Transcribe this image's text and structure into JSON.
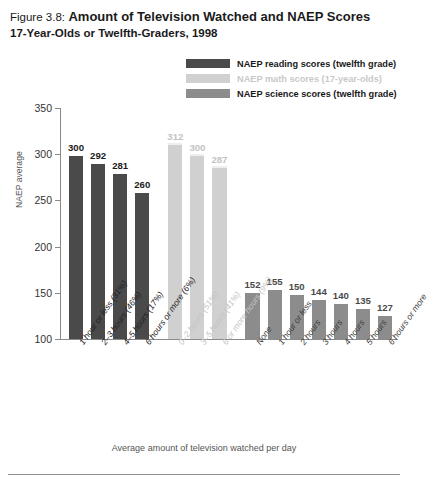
{
  "figure": {
    "number": "Figure 3.8:",
    "title": "Amount of Television Watched and NAEP Scores",
    "subtitle": "17-Year-Olds or Twelfth-Graders, 1998"
  },
  "legend": [
    {
      "label": "NAEP reading scores (twelfth grade)",
      "color": "#4a4a4a"
    },
    {
      "label": "NAEP math scores (17-year-olds)",
      "color": "#d0d0d0"
    },
    {
      "label": "NAEP science scores (twelfth grade)",
      "color": "#8c8c8c"
    }
  ],
  "chart_data": {
    "type": "bar",
    "title": "Amount of Television Watched and NAEP Scores",
    "subtitle": "17-Year-Olds or Twelfth-Graders, 1998",
    "xlabel": "Average amount of television watched per day",
    "ylabel": "NAEP average",
    "ylim": [
      100,
      350
    ],
    "yticks": [
      100,
      150,
      200,
      250,
      300,
      350
    ],
    "grid": false,
    "legend_position": "top-right",
    "series": [
      {
        "name": "NAEP reading scores (twelfth grade)",
        "color": "#4a4a4a",
        "categories": [
          "1 hour or less (31%)",
          "2–3 hours (46%)",
          "4–5 hours (17%)",
          "6 hours or more (6%)"
        ],
        "values": [
          300,
          292,
          281,
          260
        ]
      },
      {
        "name": "NAEP math scores (17-year-olds)",
        "color": "#d0d0d0",
        "categories": [
          "0–2 hours (51%)",
          "3–5 hours (41%)",
          "6 or more hours (9%)"
        ],
        "values": [
          312,
          300,
          287
        ]
      },
      {
        "name": "NAEP science scores (twelfth grade)",
        "color": "#8c8c8c",
        "categories": [
          "None",
          "1 hour or less",
          "2 hours",
          "3 hours",
          "4 hours",
          "5 hours",
          "6 hours or more"
        ],
        "values": [
          152,
          155,
          150,
          144,
          140,
          135,
          127
        ]
      }
    ]
  }
}
